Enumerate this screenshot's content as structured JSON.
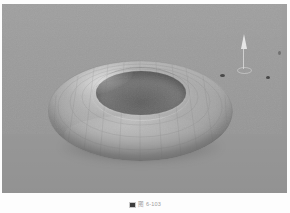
{
  "document": {
    "kind": "scanned-figure",
    "background_color": "#fdfdfd"
  },
  "viewport": {
    "label": "3d-render-viewport",
    "background_color": "#9a9a9a",
    "render_style": "grayscale shaded solid with faint wireframe",
    "object": {
      "name": "torus",
      "common_name": "donut",
      "shading": "smooth gouraud grayscale",
      "wireframe_visible": true,
      "highlight_color": "#dcdcdc",
      "midtone_color": "#9a9a9a",
      "shadow_color": "#616161",
      "hole_color": "#5f5f5f"
    },
    "gizmo": {
      "name": "light-gizmo",
      "description": "small pale cone manipulator with stem and elliptical base",
      "color": "#f6f6f6"
    },
    "specks": [
      {
        "name": "speck-a"
      },
      {
        "name": "speck-b"
      },
      {
        "name": "speck-c"
      }
    ]
  },
  "caption": {
    "icon": "figure-marker-icon",
    "text": "图 6-103"
  }
}
